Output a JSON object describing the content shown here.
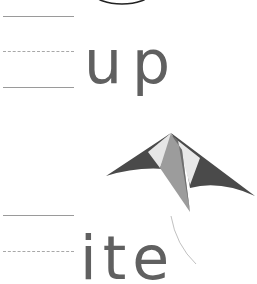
{
  "worksheet": {
    "rows": [
      {
        "word": "up",
        "guides": [
          "solid",
          "dashed",
          "solid"
        ]
      },
      {
        "word": "ite",
        "guides": [
          "solid",
          "dashed"
        ]
      }
    ]
  },
  "illustrations": {
    "top_shape": "oval-outline-icon",
    "kite": "kite-icon",
    "string": "kite-string"
  },
  "colors": {
    "text": "#606060",
    "guide_line": "#9a9a9a",
    "kite_dark": "#4a4a4a",
    "kite_light": "#e6e6e6",
    "kite_mid": "#9c9c9c"
  }
}
